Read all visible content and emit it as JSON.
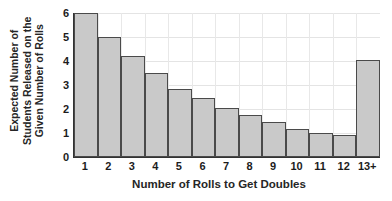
{
  "chart_data": {
    "type": "bar",
    "title": "",
    "xlabel": "Number of Rolls to Get Doubles",
    "ylabel_lines": [
      "Expected Number of",
      "Students Released on the",
      "Given Number of Rolls"
    ],
    "ylabel": "Expected Number of Students Released on the Given Number of Rolls",
    "categories": [
      "1",
      "2",
      "3",
      "4",
      "5",
      "6",
      "7",
      "8",
      "9",
      "10",
      "11",
      "12",
      "13+"
    ],
    "values": [
      6.0,
      5.0,
      4.2,
      3.5,
      2.85,
      2.45,
      2.05,
      1.75,
      1.45,
      1.15,
      1.0,
      0.92,
      4.05
    ],
    "ylim": [
      0,
      6
    ],
    "yticks": [
      0,
      1,
      2,
      3,
      4,
      5,
      6
    ],
    "ytick_labels": [
      "0",
      "1",
      "2",
      "3",
      "4",
      "5",
      "6"
    ],
    "grid": true,
    "legend": false,
    "bar_fill_color": "#c9c9c9",
    "bar_border_color": "#4a4a4a",
    "axis_color": "#333333",
    "grid_color": "#e4e4e4",
    "background_color": "#ffffff"
  }
}
